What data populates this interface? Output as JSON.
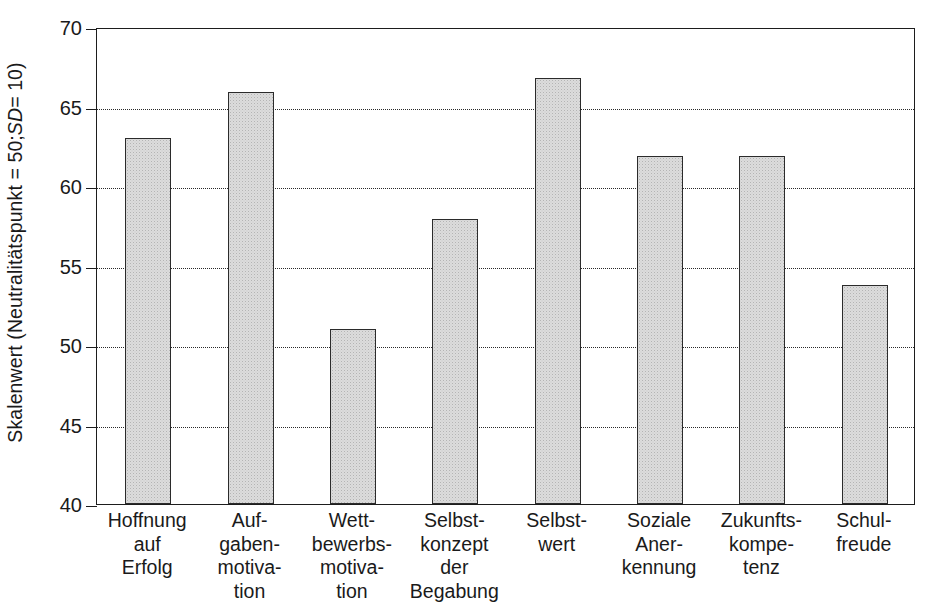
{
  "chart_data": {
    "type": "bar",
    "title": "",
    "xlabel": "",
    "ylabel": "Skalenwert (Neutralitätspunkt = 50; SD = 10)",
    "ylabel_parts": {
      "before": "Skalenwert (Neutralitätspunkt = 50; ",
      "italic": "SD",
      "after": " = 10)"
    },
    "ylim": [
      40,
      70
    ],
    "ytick_labels": [
      "70",
      "65",
      "60",
      "55",
      "50",
      "45",
      "40"
    ],
    "yticks": [
      70,
      65,
      60,
      55,
      50,
      45,
      40
    ],
    "grid": "horizontal-dotted",
    "legend": "none",
    "categories": [
      "Hoffnung\nauf\nErfolg",
      "Auf-\ngaben-\nmotiva-\ntion",
      "Wett-\nbewerbs-\nmotiva-\ntion",
      "Selbst-\nkonzept\nder\nBegabung",
      "Selbst-\nwert",
      "Soziale\nAner-\nkennung",
      "Zukunfts-\nkompe-\ntenz",
      "Schul-\nfreude"
    ],
    "values": [
      63.0,
      65.9,
      51.0,
      57.9,
      66.8,
      61.9,
      61.9,
      53.8
    ],
    "bar_fill": "#dcdcdc",
    "bar_border": "#2b2b2b",
    "axis_color": "#1d1d1d",
    "grid_color": "#2a2a2a",
    "background": "#ffffff"
  }
}
